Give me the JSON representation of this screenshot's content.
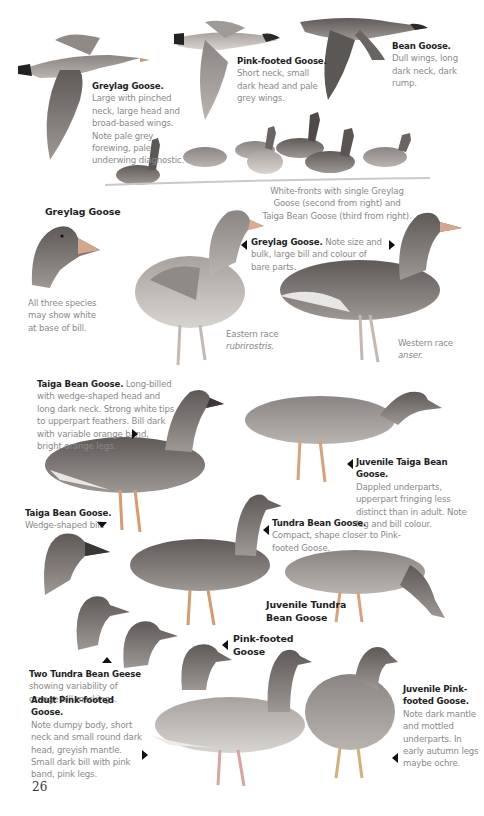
{
  "page": {
    "number": "26",
    "sections": {
      "flight": {
        "greylag": {
          "title": "Greylag Goose.",
          "text": "Large with pinched neck, large head and broad-based wings. Note pale grey forewing, pale underwing diagnostic."
        },
        "pinkfooted": {
          "title": "Pink-footed Goose.",
          "text": "Short neck, small dark head and pale grey wings."
        },
        "bean": {
          "title": "Bean Goose.",
          "text": "Dull wings, long dark neck, dark rump."
        }
      },
      "flock_caption": "White-fronts with single Greylag Goose (second from right) and Taiga Bean Goose (third from right).",
      "greylag_head": {
        "title": "Greylag Goose",
        "text": "All three species may show white at base of bill."
      },
      "greylag_standing": {
        "title": "Greylag Goose.",
        "text": "Note size and bulk, large bill and colour of bare parts."
      },
      "eastern_race": {
        "label": "Eastern race",
        "latin": "rubrirostris."
      },
      "western_race": {
        "label": "Western race",
        "latin": "anser."
      },
      "taiga": {
        "title": "Taiga Bean Goose.",
        "text": "Long-billed with wedge-shaped head and long dark neck. Strong white tips to upperpart feathers. Bill dark with variable orange band, bright orange legs."
      },
      "juv_taiga": {
        "title": "Juvenile Taiga Bean Goose.",
        "text": "Dappled underparts, upperpart fringing less distinct than in adult. Note leg and bill colour."
      },
      "taiga_head": {
        "title": "Taiga Bean Goose.",
        "text": "Wedge-shaped bill."
      },
      "tundra": {
        "title": "Tundra Bean Goose.",
        "text": "Compact, shape closer to Pink-footed Goose."
      },
      "juv_tundra": {
        "title_line1": "Juvenile Tundra",
        "title_line2": "Bean Goose"
      },
      "pinkfooted_head": {
        "title_line1": "Pink-footed",
        "title_line2": "Goose"
      },
      "two_tundra": {
        "title": "Two Tundra Bean Geese",
        "text": "showing variability of orange bill markings."
      },
      "adult_pinkfooted": {
        "title": "Adult Pink-footed Goose.",
        "text": "Note dumpy body, short neck and small round dark head, greyish mantle. Small dark bill with pink band, pink legs."
      },
      "juv_pinkfooted": {
        "title_line1": "Juvenile Pink-",
        "title_line2": "footed Goose.",
        "text": "Note dark mantle and mottled underparts. In early autumn legs maybe ochre."
      }
    },
    "colors": {
      "caption_grey": "#8a8a8a",
      "title_black": "#1e1e1e"
    }
  }
}
